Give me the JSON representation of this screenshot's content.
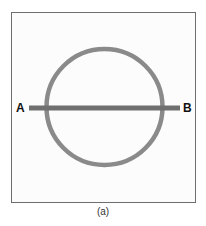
{
  "figure": {
    "caption": "(a)",
    "labels": {
      "left": "A",
      "right": "B"
    },
    "shapes": {
      "circle": {
        "cx": 104.5,
        "cy": 107,
        "r": 58,
        "stroke": "#8a8a8a",
        "stroke_width": 4.5
      },
      "line": {
        "x1": 29,
        "y1": 108,
        "x2": 180,
        "y2": 108,
        "stroke": "#6f6f6f",
        "stroke_width": 5
      }
    },
    "frame_color": "#6e6e6e"
  }
}
